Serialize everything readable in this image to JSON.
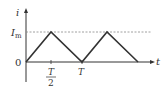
{
  "diagram": {
    "type": "triangular-wave-graph",
    "y_axis_label": "i",
    "x_axis_label": "t",
    "origin_label": "0",
    "peak_label_main": "I",
    "peak_label_sub": "m",
    "tick_half_period_num": "T",
    "tick_half_period_den": "2",
    "tick_period": "T",
    "colors": {
      "line": "#333333",
      "dashed": "#888888",
      "background": "#ffffff"
    }
  }
}
